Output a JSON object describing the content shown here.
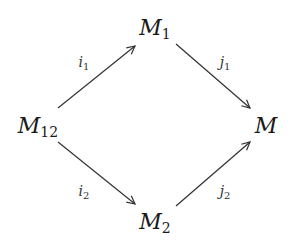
{
  "diagram": {
    "type": "commutative-diagram",
    "nodes": {
      "top": {
        "base": "M",
        "sub": "1"
      },
      "left": {
        "base": "M",
        "sub": "12"
      },
      "right": {
        "base": "M",
        "sub": ""
      },
      "bottom": {
        "base": "M",
        "sub": "2"
      }
    },
    "arrows": {
      "i1": {
        "base": "i",
        "sub": "1",
        "from": "M12",
        "to": "M1"
      },
      "j1": {
        "base": "j",
        "sub": "1",
        "from": "M1",
        "to": "M"
      },
      "i2": {
        "base": "i",
        "sub": "2",
        "from": "M12",
        "to": "M2"
      },
      "j2": {
        "base": "j",
        "sub": "2",
        "from": "M2",
        "to": "M"
      }
    },
    "colors": {
      "stroke": "#333333",
      "text": "#1a1a1a"
    }
  }
}
